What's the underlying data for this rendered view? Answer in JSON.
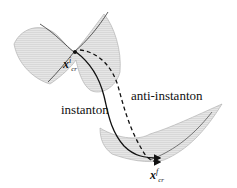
{
  "diagram": {
    "title": "",
    "nodes": [
      {
        "id": "initial",
        "symbol": "x",
        "sup": "i",
        "sub": "cr",
        "description": "initial critical point on upper saddle surface"
      },
      {
        "id": "final",
        "symbol": "x",
        "sup": "f",
        "sub": "cr",
        "description": "final critical point on lower valley surface"
      }
    ],
    "edges": [
      {
        "from": "initial",
        "to": "final",
        "label": "instanton",
        "style": "solid"
      },
      {
        "from": "initial",
        "to": "final",
        "label": "anti-instanton",
        "style": "dashed"
      }
    ],
    "labels": {
      "instanton": "instanton",
      "anti_instanton": "anti-instanton"
    },
    "colors": {
      "surface": "#d8d8d8",
      "mesh": "#a8a8a8",
      "path": "#111111"
    }
  }
}
